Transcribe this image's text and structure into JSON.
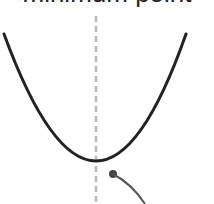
{
  "title": "minimum point",
  "diagram": {
    "curve": {
      "type": "parabola",
      "left": [
        4,
        34
      ],
      "vertex": [
        97,
        161
      ],
      "right": [
        186,
        34
      ],
      "color": "#222222"
    },
    "axis_of_symmetry": {
      "x": 96,
      "style": "dashed",
      "color": "#bbbbbb"
    },
    "marker": {
      "x": 113,
      "y": 174,
      "color": "#444444"
    },
    "pointer": {
      "color": "#555555"
    }
  }
}
